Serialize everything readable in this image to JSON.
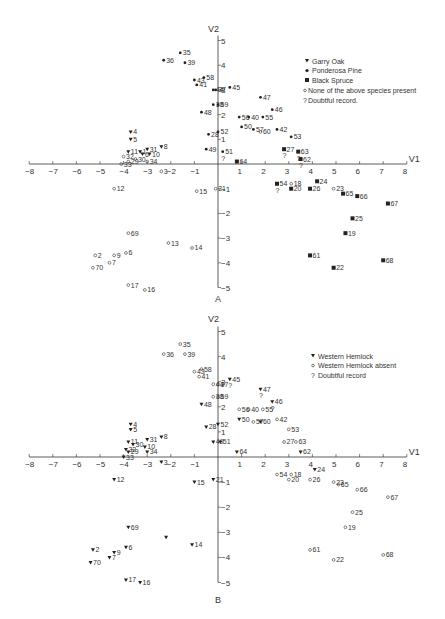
{
  "chart_data": [
    {
      "type": "scatter",
      "panel": "A",
      "xlabel": "V1",
      "ylabel": "V2",
      "xlim": [
        -8,
        8
      ],
      "ylim": [
        -5,
        5
      ],
      "xticks": [
        -8,
        -7,
        -6,
        -5,
        -4,
        -3,
        -2,
        -1,
        1,
        2,
        3,
        4,
        5,
        6,
        7,
        8
      ],
      "yticks": [
        -5,
        -4,
        -3,
        -2,
        -1,
        1,
        2,
        3,
        4,
        5
      ],
      "grid": false,
      "legend": [
        {
          "symbol": "triangle",
          "label": "Garry Oak"
        },
        {
          "symbol": "dot",
          "label": "Ponderosa Pine"
        },
        {
          "symbol": "square",
          "label": "Black Spruce"
        },
        {
          "symbol": "circle",
          "label": "None of the above species present"
        },
        {
          "symbol": "?",
          "label": "Doubtful record."
        }
      ],
      "points": [
        {
          "id": "35",
          "x": -1.6,
          "y": 4.5,
          "s": "dot"
        },
        {
          "id": "36",
          "x": -2.3,
          "y": 4.2,
          "s": "dot"
        },
        {
          "id": "39",
          "x": -1.4,
          "y": 4.1,
          "s": "dot"
        },
        {
          "id": "43",
          "x": -1.0,
          "y": 3.4,
          "s": "dot"
        },
        {
          "id": "41",
          "x": -0.9,
          "y": 3.2,
          "s": "dot"
        },
        {
          "id": "58",
          "x": -0.6,
          "y": 3.5,
          "s": "dot"
        },
        {
          "id": "44",
          "x": -0.2,
          "y": 3.0,
          "s": "dot"
        },
        {
          "id": "37",
          "x": -0.1,
          "y": 3.0,
          "s": "dot"
        },
        {
          "id": "45",
          "x": 0.5,
          "y": 3.1,
          "s": "dot"
        },
        {
          "id": "38",
          "x": -0.2,
          "y": 2.4,
          "s": "dot"
        },
        {
          "id": "59",
          "x": 0.0,
          "y": 2.4,
          "s": "dot"
        },
        {
          "id": "48",
          "x": -0.7,
          "y": 2.1,
          "s": "dot"
        },
        {
          "id": "47",
          "x": 1.8,
          "y": 2.7,
          "s": "dot"
        },
        {
          "id": "46",
          "x": 2.3,
          "y": 2.2,
          "s": "dot"
        },
        {
          "id": "56",
          "x": 0.9,
          "y": 1.9,
          "s": "dot"
        },
        {
          "id": "40",
          "x": 1.3,
          "y": 1.9,
          "s": "dot"
        },
        {
          "id": "55",
          "x": 1.9,
          "y": 1.9,
          "s": "dot"
        },
        {
          "id": "50",
          "x": 1.0,
          "y": 1.5,
          "s": "dot"
        },
        {
          "id": "57",
          "x": 1.5,
          "y": 1.4,
          "s": "dot"
        },
        {
          "id": "60",
          "x": 1.8,
          "y": 1.3,
          "s": "circle"
        },
        {
          "id": "42",
          "x": 2.5,
          "y": 1.4,
          "s": "dot"
        },
        {
          "id": "28",
          "x": -0.4,
          "y": 1.2,
          "s": "dot"
        },
        {
          "id": "52",
          "x": 0.0,
          "y": 1.3,
          "s": "dot"
        },
        {
          "id": "53",
          "x": 3.1,
          "y": 1.1,
          "s": "dot"
        },
        {
          "id": "49",
          "x": -0.5,
          "y": 0.6,
          "s": "dot"
        },
        {
          "id": "51",
          "x": 0.2,
          "y": 0.5,
          "s": "dot",
          "doubtful": true
        },
        {
          "id": "27",
          "x": 2.8,
          "y": 0.6,
          "s": "square",
          "doubtful": true
        },
        {
          "id": "63",
          "x": 3.4,
          "y": 0.5,
          "s": "square",
          "doubtful": true
        },
        {
          "id": "62",
          "x": 3.5,
          "y": 0.2,
          "s": "square",
          "doubtful": true
        },
        {
          "id": "64",
          "x": 0.8,
          "y": 0.1,
          "s": "square"
        },
        {
          "id": "4",
          "x": -3.7,
          "y": 1.3,
          "s": "triangle"
        },
        {
          "id": "5",
          "x": -3.7,
          "y": 1.0,
          "s": "triangle"
        },
        {
          "id": "8",
          "x": -2.4,
          "y": 0.7,
          "s": "triangle"
        },
        {
          "id": "11",
          "x": -3.8,
          "y": 0.5,
          "s": "triangle"
        },
        {
          "id": "1",
          "x": -3.3,
          "y": 0.5,
          "s": "triangle"
        },
        {
          "id": "31",
          "x": -3.0,
          "y": 0.6,
          "s": "triangle"
        },
        {
          "id": "6",
          "x": -3.2,
          "y": 0.4,
          "s": "triangle"
        },
        {
          "id": "10",
          "x": -2.9,
          "y": 0.4,
          "s": "triangle"
        },
        {
          "id": "32",
          "x": -4.0,
          "y": 0.3,
          "s": "circle"
        },
        {
          "id": "29",
          "x": -3.8,
          "y": 0.1,
          "s": "circle"
        },
        {
          "id": "30",
          "x": -3.5,
          "y": 0.2,
          "s": "circle"
        },
        {
          "id": "33",
          "x": -4.1,
          "y": 0.0,
          "s": "circle"
        },
        {
          "id": "34",
          "x": -3.0,
          "y": 0.1,
          "s": "circle"
        },
        {
          "id": "3",
          "x": -2.4,
          "y": -0.3,
          "s": "circle"
        },
        {
          "id": "12",
          "x": -4.4,
          "y": -1.0,
          "s": "circle"
        },
        {
          "id": "15",
          "x": -0.9,
          "y": -1.1,
          "s": "circle"
        },
        {
          "id": "21",
          "x": -0.1,
          "y": -1.0,
          "s": "circle"
        },
        {
          "id": "54",
          "x": 2.5,
          "y": -0.8,
          "s": "square",
          "doubtful": true
        },
        {
          "id": "18",
          "x": 3.1,
          "y": -0.8,
          "s": "circle"
        },
        {
          "id": "24",
          "x": 4.2,
          "y": -0.7,
          "s": "square"
        },
        {
          "id": "26",
          "x": 3.9,
          "y": -1.0,
          "s": "square"
        },
        {
          "id": "20",
          "x": 3.1,
          "y": -1.0,
          "s": "square"
        },
        {
          "id": "23",
          "x": 4.9,
          "y": -1.0,
          "s": "circle"
        },
        {
          "id": "65",
          "x": 5.3,
          "y": -1.2,
          "s": "square"
        },
        {
          "id": "66",
          "x": 5.9,
          "y": -1.3,
          "s": "square"
        },
        {
          "id": "67",
          "x": 7.2,
          "y": -1.6,
          "s": "square"
        },
        {
          "id": "25",
          "x": 5.7,
          "y": -2.2,
          "s": "square"
        },
        {
          "id": "19",
          "x": 5.4,
          "y": -2.8,
          "s": "square"
        },
        {
          "id": "61",
          "x": 3.9,
          "y": -3.7,
          "s": "square"
        },
        {
          "id": "22",
          "x": 4.9,
          "y": -4.2,
          "s": "square"
        },
        {
          "id": "68",
          "x": 7.0,
          "y": -3.9,
          "s": "square"
        },
        {
          "id": "69",
          "x": -3.8,
          "y": -2.8,
          "s": "circle"
        },
        {
          "id": "13",
          "x": -2.1,
          "y": -3.2,
          "s": "circle"
        },
        {
          "id": "14",
          "x": -1.1,
          "y": -3.4,
          "s": "circle"
        },
        {
          "id": "2",
          "x": -5.2,
          "y": -3.7,
          "s": "circle"
        },
        {
          "id": "9",
          "x": -4.4,
          "y": -3.7,
          "s": "circle"
        },
        {
          "id": "6b",
          "x": -3.9,
          "y": -3.6,
          "s": "circle"
        },
        {
          "id": "7",
          "x": -4.6,
          "y": -4.0,
          "s": "circle"
        },
        {
          "id": "70",
          "x": -5.3,
          "y": -4.2,
          "s": "circle"
        },
        {
          "id": "17",
          "x": -3.8,
          "y": -4.9,
          "s": "circle"
        },
        {
          "id": "16",
          "x": -3.1,
          "y": -5.1,
          "s": "circle"
        }
      ]
    },
    {
      "type": "scatter",
      "panel": "B",
      "xlabel": "V1",
      "ylabel": "V2",
      "xlim": [
        -8,
        8
      ],
      "ylim": [
        -5,
        5
      ],
      "xticks": [
        -8,
        -7,
        -6,
        -5,
        -4,
        -3,
        -2,
        -1,
        1,
        2,
        3,
        4,
        5,
        6,
        7,
        8
      ],
      "yticks": [
        -5,
        -4,
        -3,
        -2,
        -1,
        1,
        2,
        3,
        4,
        5
      ],
      "grid": false,
      "legend": [
        {
          "symbol": "triangle",
          "label": "Western Hemlock"
        },
        {
          "symbol": "circle",
          "label": "Western Hemlock absent"
        },
        {
          "symbol": "?",
          "label": "Doubtful record"
        }
      ],
      "points": [
        {
          "id": "35",
          "x": -1.6,
          "y": 4.5,
          "s": "circle"
        },
        {
          "id": "36",
          "x": -2.3,
          "y": 4.1,
          "s": "circle"
        },
        {
          "id": "39",
          "x": -1.4,
          "y": 4.1,
          "s": "circle"
        },
        {
          "id": "43",
          "x": -1.0,
          "y": 3.4,
          "s": "circle"
        },
        {
          "id": "41",
          "x": -0.8,
          "y": 3.2,
          "s": "circle"
        },
        {
          "id": "58",
          "x": -0.7,
          "y": 3.5,
          "s": "circle"
        },
        {
          "id": "44",
          "x": -0.2,
          "y": 2.9,
          "s": "circle"
        },
        {
          "id": "37",
          "x": 0.0,
          "y": 2.9,
          "s": "circle"
        },
        {
          "id": "45",
          "x": 0.5,
          "y": 3.1,
          "s": "triangle",
          "doubtful": true
        },
        {
          "id": "38",
          "x": -0.2,
          "y": 2.4,
          "s": "circle"
        },
        {
          "id": "59",
          "x": 0.0,
          "y": 2.4,
          "s": "circle"
        },
        {
          "id": "48",
          "x": -0.7,
          "y": 2.1,
          "s": "triangle"
        },
        {
          "id": "47",
          "x": 1.8,
          "y": 2.7,
          "s": "triangle",
          "doubtful": true
        },
        {
          "id": "46",
          "x": 2.3,
          "y": 2.2,
          "s": "triangle",
          "doubtful": true
        },
        {
          "id": "56",
          "x": 0.9,
          "y": 1.9,
          "s": "circle"
        },
        {
          "id": "40",
          "x": 1.3,
          "y": 1.9,
          "s": "circle"
        },
        {
          "id": "55",
          "x": 1.9,
          "y": 1.9,
          "s": "circle"
        },
        {
          "id": "50",
          "x": 0.9,
          "y": 1.5,
          "s": "triangle"
        },
        {
          "id": "57",
          "x": 1.5,
          "y": 1.4,
          "s": "circle"
        },
        {
          "id": "60",
          "x": 1.8,
          "y": 1.4,
          "s": "triangle"
        },
        {
          "id": "42",
          "x": 2.5,
          "y": 1.5,
          "s": "circle"
        },
        {
          "id": "28",
          "x": -0.5,
          "y": 1.2,
          "s": "triangle"
        },
        {
          "id": "52",
          "x": 0.0,
          "y": 1.3,
          "s": "triangle"
        },
        {
          "id": "53",
          "x": 3.0,
          "y": 1.1,
          "s": "circle"
        },
        {
          "id": "49",
          "x": -0.2,
          "y": 0.6,
          "s": "triangle"
        },
        {
          "id": "51",
          "x": 0.1,
          "y": 0.6,
          "s": "triangle"
        },
        {
          "id": "27",
          "x": 2.8,
          "y": 0.6,
          "s": "circle"
        },
        {
          "id": "63",
          "x": 3.3,
          "y": 0.6,
          "s": "circle"
        },
        {
          "id": "62",
          "x": 3.5,
          "y": 0.2,
          "s": "triangle"
        },
        {
          "id": "64",
          "x": 0.8,
          "y": 0.2,
          "s": "triangle"
        },
        {
          "id": "4",
          "x": -3.7,
          "y": 1.3,
          "s": "triangle"
        },
        {
          "id": "5",
          "x": -3.7,
          "y": 1.1,
          "s": "triangle"
        },
        {
          "id": "8",
          "x": -2.4,
          "y": 0.8,
          "s": "triangle"
        },
        {
          "id": "11",
          "x": -3.8,
          "y": 0.6,
          "s": "triangle"
        },
        {
          "id": "30",
          "x": -3.6,
          "y": 0.5,
          "s": "triangle"
        },
        {
          "id": "31",
          "x": -3.0,
          "y": 0.7,
          "s": "triangle"
        },
        {
          "id": "10",
          "x": -3.1,
          "y": 0.4,
          "s": "triangle"
        },
        {
          "id": "32",
          "x": -3.9,
          "y": 0.3,
          "s": "triangle"
        },
        {
          "id": "29",
          "x": -3.8,
          "y": 0.2,
          "s": "triangle"
        },
        {
          "id": "34",
          "x": -3.0,
          "y": 0.2,
          "s": "triangle"
        },
        {
          "id": "33",
          "x": -4.0,
          "y": 0.0,
          "s": "triangle"
        },
        {
          "id": "3",
          "x": -2.4,
          "y": -0.2,
          "s": "triangle"
        },
        {
          "id": "12",
          "x": -4.4,
          "y": -0.9,
          "s": "triangle"
        },
        {
          "id": "15",
          "x": -1.0,
          "y": -1.0,
          "s": "triangle"
        },
        {
          "id": "21",
          "x": -0.2,
          "y": -0.9,
          "s": "triangle"
        },
        {
          "id": "54",
          "x": 2.5,
          "y": -0.7,
          "s": "circle"
        },
        {
          "id": "18",
          "x": 3.1,
          "y": -0.7,
          "s": "circle"
        },
        {
          "id": "24",
          "x": 4.1,
          "y": -0.5,
          "s": "triangle"
        },
        {
          "id": "26",
          "x": 3.9,
          "y": -0.9,
          "s": "circle"
        },
        {
          "id": "20",
          "x": 3.0,
          "y": -0.9,
          "s": "circle"
        },
        {
          "id": "23",
          "x": 4.9,
          "y": -1.0,
          "s": "circle"
        },
        {
          "id": "65",
          "x": 5.1,
          "y": -1.1,
          "s": "circle"
        },
        {
          "id": "66",
          "x": 5.9,
          "y": -1.3,
          "s": "circle"
        },
        {
          "id": "67",
          "x": 7.2,
          "y": -1.6,
          "s": "circle"
        },
        {
          "id": "25",
          "x": 5.7,
          "y": -2.2,
          "s": "circle"
        },
        {
          "id": "19",
          "x": 5.4,
          "y": -2.8,
          "s": "circle"
        },
        {
          "id": "61",
          "x": 3.9,
          "y": -3.7,
          "s": "circle"
        },
        {
          "id": "22",
          "x": 4.9,
          "y": -4.1,
          "s": "circle"
        },
        {
          "id": "68",
          "x": 7.0,
          "y": -3.9,
          "s": "circle"
        },
        {
          "id": "69",
          "x": -3.8,
          "y": -2.8,
          "s": "triangle"
        },
        {
          "id": "",
          "x": -2.2,
          "y": -3.2,
          "s": "triangle"
        },
        {
          "id": "14",
          "x": -1.1,
          "y": -3.5,
          "s": "triangle"
        },
        {
          "id": "2",
          "x": -5.3,
          "y": -3.7,
          "s": "triangle"
        },
        {
          "id": "9",
          "x": -4.4,
          "y": -3.8,
          "s": "triangle"
        },
        {
          "id": "6",
          "x": -3.9,
          "y": -3.6,
          "s": "triangle"
        },
        {
          "id": "7",
          "x": -4.6,
          "y": -4.0,
          "s": "triangle"
        },
        {
          "id": "70",
          "x": -5.4,
          "y": -4.2,
          "s": "triangle"
        },
        {
          "id": "17",
          "x": -3.9,
          "y": -4.9,
          "s": "triangle"
        },
        {
          "id": "16",
          "x": -3.3,
          "y": -5.0,
          "s": "triangle"
        }
      ]
    }
  ],
  "panels": {
    "a": {
      "label": "A",
      "xaxis": "V1",
      "yaxis": "V2"
    },
    "b": {
      "label": "B",
      "xaxis": "V1",
      "yaxis": "V2"
    }
  },
  "legend_a": [
    "Garry Oak",
    "Ponderosa Pine",
    "Black Spruce",
    "None of the above species present",
    "Doubtful record."
  ],
  "legend_b": [
    "Western Hemlock",
    "Western Hemlock absent",
    "Doubtful record"
  ]
}
